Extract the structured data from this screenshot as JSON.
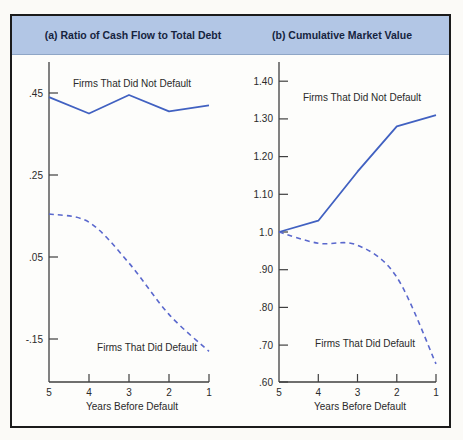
{
  "header": {
    "background": "#b2c6e5",
    "text_color": "#16243f"
  },
  "frame": {
    "border_color": "#1b1b1b"
  },
  "colors": {
    "solid_line": "#4161c1",
    "dashed_line": "#5a68cd",
    "axis": "#3f3f3f",
    "tick_text": "#2a2a2a"
  },
  "chart_data": [
    {
      "type": "line",
      "title": "(a) Ratio of Cash Flow to Total Debt",
      "xlabel": "Years Before Default",
      "x_tick_labels": [
        "5",
        "4",
        "3",
        "2",
        "1"
      ],
      "categories": [
        5,
        4,
        3,
        2,
        1
      ],
      "yticks": [
        {
          "label": ".45",
          "value": 0.45
        },
        {
          "label": ".25",
          "value": 0.25
        },
        {
          "label": ".05",
          "value": 0.05
        },
        {
          "label": "-.15",
          "value": -0.15
        }
      ],
      "ylim": [
        -0.25,
        0.52
      ],
      "grid": false,
      "legend": "inline-annotations",
      "series": [
        {
          "name": "Firms That Did Not Default",
          "style": "solid",
          "values": [
            0.44,
            0.4,
            0.445,
            0.405,
            0.42
          ]
        },
        {
          "name": "Firms That Did Default",
          "style": "dashed",
          "values": [
            0.155,
            0.135,
            0.035,
            -0.09,
            -0.18
          ]
        }
      ]
    },
    {
      "type": "line",
      "title": "(b) Cumulative Market Value",
      "xlabel": "Years Before Default",
      "x_tick_labels": [
        "5",
        "4",
        "3",
        "2",
        "1"
      ],
      "categories": [
        5,
        4,
        3,
        2,
        1
      ],
      "yticks": [
        {
          "label": "1.40",
          "value": 1.4
        },
        {
          "label": "1.30",
          "value": 1.3
        },
        {
          "label": "1.20",
          "value": 1.2
        },
        {
          "label": "1.10",
          "value": 1.1
        },
        {
          "label": "1.0",
          "value": 1.0
        },
        {
          "label": ".90",
          "value": 0.9
        },
        {
          "label": ".80",
          "value": 0.8
        },
        {
          "label": ".70",
          "value": 0.7
        },
        {
          "label": ".60",
          "value": 0.6
        }
      ],
      "ylim": [
        0.6,
        1.45
      ],
      "grid": false,
      "legend": "inline-annotations",
      "series": [
        {
          "name": "Firms That Did Not Default",
          "style": "solid",
          "values": [
            1.0,
            1.03,
            1.16,
            1.28,
            1.31
          ]
        },
        {
          "name": "Firms That Did Default",
          "style": "dashed",
          "values": [
            1.0,
            0.97,
            0.965,
            0.88,
            0.65
          ]
        }
      ]
    }
  ]
}
